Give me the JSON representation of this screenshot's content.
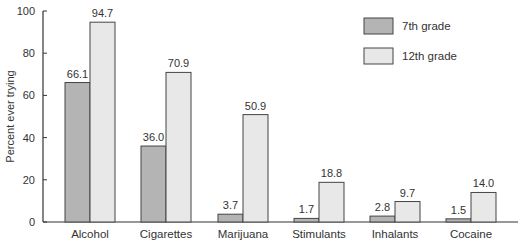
{
  "chart_data": {
    "type": "bar",
    "title": "",
    "xlabel": "",
    "ylabel": "Percent ever trying",
    "ylim": [
      0,
      100
    ],
    "yticks": [
      0,
      20,
      40,
      60,
      80,
      100
    ],
    "grid": false,
    "legend_position": "upper right",
    "categories": [
      "Alcohol",
      "Cigarettes",
      "Marijuana",
      "Stimulants",
      "Inhalants",
      "Cocaine"
    ],
    "series": [
      {
        "name": "7th grade",
        "color": "#b4b4b4",
        "values": [
          66.1,
          36.0,
          3.7,
          1.7,
          2.8,
          1.5
        ],
        "labels": [
          "66.1",
          "36.0",
          "3.7",
          "1.7",
          "2.8",
          "1.5"
        ]
      },
      {
        "name": "12th grade",
        "color": "#e8e8e8",
        "values": [
          94.7,
          70.9,
          50.9,
          18.8,
          9.7,
          14.0
        ],
        "labels": [
          "94.7",
          "70.9",
          "50.9",
          "18.8",
          "9.7",
          "14.0"
        ]
      }
    ]
  },
  "caption": "F 10 1"
}
